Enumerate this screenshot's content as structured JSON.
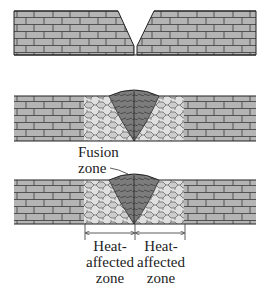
{
  "figure": {
    "type": "welding-stages-diagram",
    "panels": [
      {
        "id": "before-welding",
        "description": "Two plates with V-groove bevel"
      },
      {
        "id": "after-welding",
        "description": "Weld bead with fusion zone and heat-affected zone"
      },
      {
        "id": "annotated",
        "description": "Welded joint with zones labeled"
      }
    ],
    "colors": {
      "base_metal": "#b4b4b4",
      "grain_lines": "#3a3a3a",
      "fusion_zone": "#7a7a7a",
      "haz_light": "#e2e2e2",
      "haz_grain": "#c4c4c4",
      "outline": "#222222"
    }
  },
  "labels": {
    "fusion_zone": {
      "line1": "Fusion",
      "line2": "zone"
    },
    "haz_left": {
      "line1": "Heat-",
      "line2": "affected",
      "line3": "zone"
    },
    "haz_right": {
      "line1": "Heat-",
      "line2": "affected",
      "line3": "zone"
    }
  }
}
